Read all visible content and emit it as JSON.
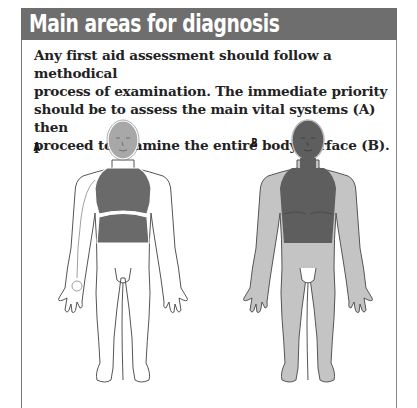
{
  "header": {
    "title": "Main areas for diagnosis"
  },
  "intro": {
    "lines": [
      "Any first aid assessment should follow a methodical",
      "process of examination. The immediate priority",
      "should be to assess the main vital systems (A) then",
      "proceed to examine the entire body surface (B)."
    ]
  },
  "figures": [
    {
      "label": "A",
      "description": "Outline body with head, chest and abdomen shaded (main vital systems)"
    },
    {
      "label": "B",
      "description": "Whole body shaded light grey with head and torso shaded dark (entire body surface)"
    }
  ],
  "colors": {
    "header_bg": "#6e6e6e",
    "vital_shade": "#6a6a6a",
    "head_shade": "#a8a8a8",
    "body_shade": "#c4c4c4",
    "outline": "#555555"
  }
}
